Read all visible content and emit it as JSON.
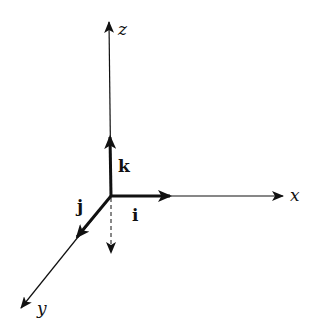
{
  "diagram": {
    "type": "3d-coordinate-axes",
    "origin": [
      111,
      196
    ],
    "axes": [
      {
        "name": "x",
        "label": "x",
        "from": [
          111,
          196
        ],
        "to": [
          283,
          196
        ]
      },
      {
        "name": "y",
        "label": "y",
        "from": [
          111,
          196
        ],
        "to": [
          21,
          308
        ]
      },
      {
        "name": "z",
        "label": "z",
        "from": [
          111,
          196
        ],
        "to": [
          109,
          22
        ]
      }
    ],
    "unit_vectors": [
      {
        "name": "i",
        "label": "i",
        "direction": "x",
        "to": [
          170,
          196
        ]
      },
      {
        "name": "j",
        "label": "j",
        "direction": "y",
        "to": [
          77,
          237
        ]
      },
      {
        "name": "k",
        "label": "k",
        "direction": "z",
        "to": [
          110,
          137
        ]
      }
    ],
    "dashed_vector": {
      "direction": "-z",
      "to": [
        111,
        253
      ]
    },
    "colors": {
      "stroke": "#111111",
      "background": "#ffffff"
    }
  }
}
